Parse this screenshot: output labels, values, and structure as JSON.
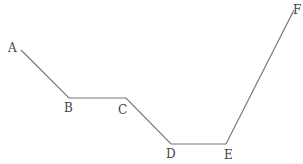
{
  "diagram": {
    "type": "polyline",
    "stroke_color": "#777777",
    "label_color": "#444444",
    "points": [
      {
        "id": "A",
        "label": "A",
        "x": 21,
        "y": 50,
        "lx": 8,
        "ly": 52
      },
      {
        "id": "B",
        "label": "B",
        "x": 69,
        "y": 98,
        "lx": 64,
        "ly": 112
      },
      {
        "id": "C",
        "label": "C",
        "x": 126,
        "y": 98,
        "lx": 118,
        "ly": 114
      },
      {
        "id": "D",
        "label": "D",
        "x": 171,
        "y": 144,
        "lx": 166,
        "ly": 158
      },
      {
        "id": "E",
        "label": "E",
        "x": 226,
        "y": 144,
        "lx": 224,
        "ly": 159
      },
      {
        "id": "F",
        "label": "F",
        "x": 294,
        "y": 10,
        "lx": 293,
        "ly": 14
      }
    ]
  },
  "labels": {
    "A": "A",
    "B": "B",
    "C": "C",
    "D": "D",
    "E": "E",
    "F": "F"
  }
}
